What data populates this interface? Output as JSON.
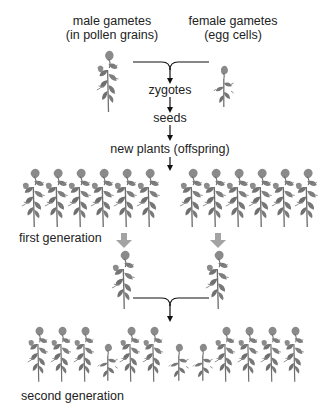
{
  "diagram": {
    "title_labels": {
      "male_line1": "male gametes",
      "male_line2": "(in pollen grains)",
      "female_line1": "female gametes",
      "female_line2": "(egg cells)"
    },
    "steps": {
      "zygotes": "zygotes",
      "seeds": "seeds",
      "new_plants": "new plants (offspring)"
    },
    "generations": {
      "first": "first generation",
      "second": "second generation"
    },
    "colors": {
      "plant": "#7a7a7a",
      "plant_dark": "#5e5e5e",
      "arrow": "#111111",
      "fat_arrow": "#9a9a9a",
      "text": "#222222"
    },
    "first_generation_plants": {
      "left_group_count": 6,
      "right_group_count": 6,
      "all_tall": true
    },
    "second_generation_pattern": [
      "tall",
      "tall",
      "tall",
      "short",
      "tall",
      "tall",
      "short",
      "short",
      "tall",
      "tall",
      "tall",
      "tall"
    ]
  }
}
